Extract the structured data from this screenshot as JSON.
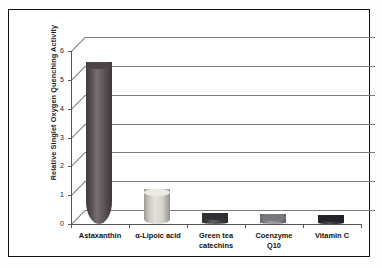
{
  "chart_data": {
    "type": "bar",
    "title": "",
    "subtitle": "",
    "xlabel": "",
    "ylabel": "Relative Singlet Oxygen Quenching Activity",
    "ylim": [
      0,
      6
    ],
    "yticks": [
      0,
      1,
      2,
      3,
      4,
      5,
      6
    ],
    "ytick_labels": [
      "0",
      "1",
      "2",
      "3",
      "4",
      "5",
      "6"
    ],
    "grid": true,
    "grid_axis": "y",
    "legend": false,
    "legend_position": "none",
    "style": "3d-cylinder",
    "categories": [
      "Astaxanthin",
      "α-Lipoic acid",
      "Green tea catechins",
      "Coenzyme Q10",
      "Vitamin C"
    ],
    "category_lines": [
      [
        "Astaxanthin"
      ],
      [
        "α-Lipoic acid"
      ],
      [
        "Green tea",
        "catechins"
      ],
      [
        "Coenzyme",
        "Q10"
      ],
      [
        "Vitamin C"
      ]
    ],
    "values": [
      5.5,
      1.1,
      0.27,
      0.22,
      0.18
    ],
    "bar_colors": [
      "#5d5458",
      "#dedbd4",
      "#3f3f45",
      "#8d8d92",
      "#2e2e34"
    ],
    "bar_cap_colors": [
      "#4a4246",
      "#eceae5",
      "#2f2f36",
      "#77777c",
      "#222228"
    ]
  },
  "axis": {
    "y_title": "Relative Singlet Oxygen Quenching Activity"
  }
}
